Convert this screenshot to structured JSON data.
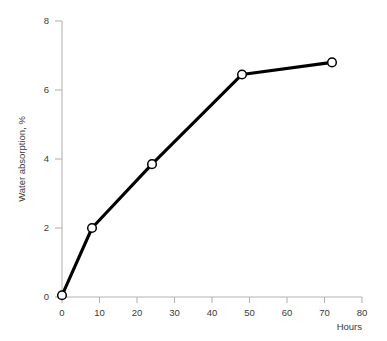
{
  "chart_data": {
    "type": "line",
    "title": "",
    "subtitle": "",
    "xlabel": "Hours",
    "ylabel": "Water absorption, %",
    "xlim": [
      0,
      80
    ],
    "ylim": [
      0,
      8
    ],
    "xticks": [
      0,
      10,
      20,
      30,
      40,
      50,
      60,
      70,
      80
    ],
    "yticks": [
      0,
      2,
      4,
      6,
      8
    ],
    "xtick_labels": [
      "0",
      "10",
      "20",
      "30",
      "40",
      "50",
      "60",
      "70",
      "80"
    ],
    "ytick_labels": [
      "0",
      "2",
      "4",
      "6",
      "8"
    ],
    "grid": false,
    "legend": false,
    "legend_position": "none",
    "marker": "open-circle",
    "line_color": "#000000",
    "marker_fill": "#ffffff",
    "marker_edge_color": "#000000",
    "axis_color": "#b4b4b4",
    "text_color": "#3a3a3a",
    "x": [
      0,
      8,
      24,
      48,
      72
    ],
    "values": [
      0.05,
      2.0,
      3.85,
      6.45,
      6.8
    ],
    "series": [
      {
        "name": "Water absorption",
        "points": [
          {
            "x": 0,
            "y": 0.05
          },
          {
            "x": 8,
            "y": 2.0
          },
          {
            "x": 24,
            "y": 3.85
          },
          {
            "x": 48,
            "y": 6.45
          },
          {
            "x": 72,
            "y": 6.8
          }
        ]
      }
    ]
  }
}
